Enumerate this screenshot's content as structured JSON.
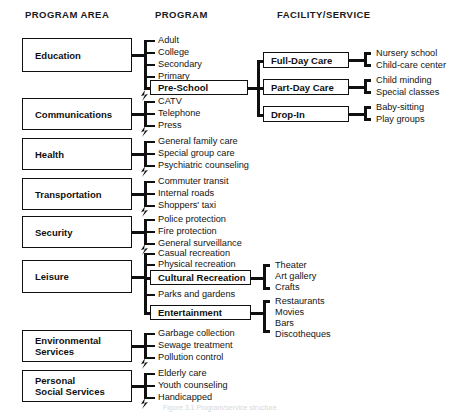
{
  "figure": {
    "caption": "Figure 3.1  Program/service structure"
  },
  "headers": {
    "program_area": "PROGRAM AREA",
    "program": "PROGRAM",
    "facility_service": "FACILITY/SERVICE"
  },
  "program_areas": [
    {
      "id": "education",
      "label": "Education"
    },
    {
      "id": "communications",
      "label": "Communications"
    },
    {
      "id": "health",
      "label": "Health"
    },
    {
      "id": "transportation",
      "label": "Transportation"
    },
    {
      "id": "security",
      "label": "Security"
    },
    {
      "id": "leisure",
      "label": "Leisure"
    },
    {
      "id": "environmental",
      "label_line1": "Environmental",
      "label_line2": "Services"
    },
    {
      "id": "personal_social",
      "label_line1": "Personal",
      "label_line2": "Social Services"
    }
  ],
  "programs": {
    "education": [
      {
        "label": "Adult",
        "boxed": false
      },
      {
        "label": "College",
        "boxed": false
      },
      {
        "label": "Secondary",
        "boxed": false
      },
      {
        "label": "Primary",
        "boxed": false
      },
      {
        "label": "Pre-School",
        "boxed": true
      }
    ],
    "communications": [
      {
        "label": "CATV",
        "boxed": false
      },
      {
        "label": "Telephone",
        "boxed": false
      },
      {
        "label": "Press",
        "boxed": false
      }
    ],
    "health": [
      {
        "label": "General family care",
        "boxed": false
      },
      {
        "label": "Special group care",
        "boxed": false
      },
      {
        "label": "Psychiatric counseling",
        "boxed": false
      }
    ],
    "transportation": [
      {
        "label": "Commuter transit",
        "boxed": false
      },
      {
        "label": "Internal roads",
        "boxed": false
      },
      {
        "label": "Shoppers' taxi",
        "boxed": false
      }
    ],
    "security": [
      {
        "label": "Police protection",
        "boxed": false
      },
      {
        "label": "Fire protection",
        "boxed": false
      },
      {
        "label": "General surveillance",
        "boxed": false
      }
    ],
    "leisure": [
      {
        "label": "Casual recreation",
        "boxed": false
      },
      {
        "label": "Physical recreation",
        "boxed": false
      },
      {
        "label": "Cultural Recreation",
        "boxed": true
      },
      {
        "label": "Parks and gardens",
        "boxed": false
      },
      {
        "label": "Entertainment",
        "boxed": true
      }
    ],
    "environmental": [
      {
        "label": "Garbage collection",
        "boxed": false
      },
      {
        "label": "Sewage treatment",
        "boxed": false
      },
      {
        "label": "Pollution control",
        "boxed": false
      }
    ],
    "personal_social": [
      {
        "label": "Elderly care",
        "boxed": false
      },
      {
        "label": "Youth counseling",
        "boxed": false
      },
      {
        "label": "Handicapped",
        "boxed": false
      }
    ]
  },
  "preschool_facilities": [
    {
      "label": "Full-Day Care",
      "services": [
        "Nursery school",
        "Child-care center"
      ]
    },
    {
      "label": "Part-Day Care",
      "services": [
        "Child minding",
        "Special classes"
      ]
    },
    {
      "label": "Drop-In",
      "services": [
        "Baby-sitting",
        "Play groups"
      ]
    }
  ],
  "leisure_facilities": {
    "cultural_recreation": [
      "Theater",
      "Art gallery",
      "Crafts"
    ],
    "entertainment": [
      "Restaurants",
      "Movies",
      "Bars",
      "Discotheques"
    ]
  },
  "colors": {
    "line": "#101010",
    "text": "#141414",
    "background": "#ffffff"
  }
}
